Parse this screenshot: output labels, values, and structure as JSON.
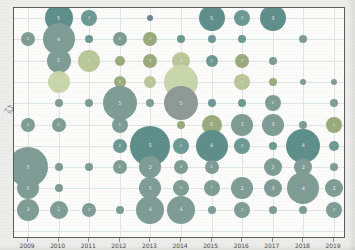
{
  "chart_data": {
    "type": "scatter",
    "title": "",
    "xlabel": "",
    "ylabel": "心",
    "grid": true,
    "legend": null,
    "x_tick_labels": [
      "2009",
      "2010",
      "2011",
      "2012",
      "2013",
      "2014",
      "2015",
      "2016",
      "2017",
      "2018",
      "2019"
    ],
    "x_values": [
      2009,
      2010,
      2011,
      2012,
      2013,
      2014,
      2015,
      2016,
      2017,
      2018,
      2019
    ],
    "y_rows": 11,
    "size_encodes": "count",
    "label_shows": "count",
    "colors": {
      "dark_teal": "#5f8f8b",
      "teal": "#6d9a94",
      "gray_teal": "#7f9c97",
      "olive": "#9aab7e",
      "light_olive": "#b9c79a",
      "pale_green": "#c9d6ac",
      "slate": "#6f8790",
      "muted_gray": "#8d9a96",
      "grid": "#dfe4e4",
      "frame": "#5c5c5a",
      "plot_bg": "#fbfbfa",
      "page_bg": "#ececeb"
    },
    "points": [
      {
        "col": 1,
        "row": 0,
        "v": 5,
        "r": 14,
        "c": "dark_teal"
      },
      {
        "col": 2,
        "row": 0,
        "v": 2,
        "r": 8,
        "c": "teal"
      },
      {
        "col": 4,
        "row": 0,
        "v": 1,
        "r": 3,
        "c": "slate"
      },
      {
        "col": 6,
        "row": 0,
        "v": 5,
        "r": 13,
        "c": "dark_teal"
      },
      {
        "col": 7,
        "row": 0,
        "v": 2,
        "r": 8,
        "c": "teal"
      },
      {
        "col": 8,
        "row": 0,
        "v": 3,
        "r": 13,
        "c": "dark_teal"
      },
      {
        "col": 0,
        "row": 1,
        "v": 2,
        "r": 7,
        "c": "gray_teal"
      },
      {
        "col": 1,
        "row": 1,
        "v": 4,
        "r": 16,
        "c": "gray_teal"
      },
      {
        "col": 2,
        "row": 1,
        "v": 1,
        "r": 4,
        "c": "teal"
      },
      {
        "col": 3,
        "row": 1,
        "v": 2,
        "r": 7,
        "c": "gray_teal"
      },
      {
        "col": 4,
        "row": 1,
        "v": 2,
        "r": 7,
        "c": "olive"
      },
      {
        "col": 5,
        "row": 1,
        "v": 1,
        "r": 4,
        "c": "teal"
      },
      {
        "col": 6,
        "row": 1,
        "v": 1,
        "r": 4,
        "c": "teal"
      },
      {
        "col": 7,
        "row": 1,
        "v": 1,
        "r": 4,
        "c": "teal"
      },
      {
        "col": 9,
        "row": 1,
        "v": 1,
        "r": 4,
        "c": "gray_teal"
      },
      {
        "col": 1,
        "row": 2,
        "v": 5,
        "r": 12,
        "c": "gray_teal"
      },
      {
        "col": 2,
        "row": 2,
        "v": 1,
        "r": 11,
        "c": "light_olive"
      },
      {
        "col": 3,
        "row": 2,
        "v": 1,
        "r": 5,
        "c": "olive"
      },
      {
        "col": 4,
        "row": 2,
        "v": 2,
        "r": 7,
        "c": "olive"
      },
      {
        "col": 5,
        "row": 2,
        "v": 1,
        "r": 9,
        "c": "light_olive"
      },
      {
        "col": 6,
        "row": 2,
        "v": 2,
        "r": 6,
        "c": "teal"
      },
      {
        "col": 7,
        "row": 2,
        "v": 2,
        "r": 7,
        "c": "olive"
      },
      {
        "col": 8,
        "row": 2,
        "v": 1,
        "r": 4,
        "c": "gray_teal"
      },
      {
        "col": 1,
        "row": 3,
        "v": 3,
        "r": 11,
        "c": "pale_green"
      },
      {
        "col": 3,
        "row": 3,
        "v": 2,
        "r": 6,
        "c": "olive"
      },
      {
        "col": 4,
        "row": 3,
        "v": 2,
        "r": 6,
        "c": "light_olive"
      },
      {
        "col": 5,
        "row": 3,
        "v": 5,
        "r": 17,
        "c": "pale_green"
      },
      {
        "col": 7,
        "row": 3,
        "v": 2,
        "r": 8,
        "c": "light_olive"
      },
      {
        "col": 8,
        "row": 3,
        "v": 1,
        "r": 4,
        "c": "olive"
      },
      {
        "col": 9,
        "row": 3,
        "v": 1,
        "r": 3,
        "c": "gray_teal"
      },
      {
        "col": 10,
        "row": 3,
        "v": 1,
        "r": 3,
        "c": "gray_teal"
      },
      {
        "col": 1,
        "row": 4,
        "v": 1,
        "r": 4,
        "c": "gray_teal"
      },
      {
        "col": 2,
        "row": 4,
        "v": 1,
        "r": 4,
        "c": "gray_teal"
      },
      {
        "col": 3,
        "row": 4,
        "v": 5,
        "r": 17,
        "c": "gray_teal"
      },
      {
        "col": 4,
        "row": 4,
        "v": 1,
        "r": 4,
        "c": "gray_teal"
      },
      {
        "col": 5,
        "row": 4,
        "v": 5,
        "r": 17,
        "c": "muted_gray"
      },
      {
        "col": 6,
        "row": 4,
        "v": 1,
        "r": 4,
        "c": "teal"
      },
      {
        "col": 7,
        "row": 4,
        "v": 1,
        "r": 4,
        "c": "teal"
      },
      {
        "col": 8,
        "row": 4,
        "v": 2,
        "r": 8,
        "c": "gray_teal"
      },
      {
        "col": 10,
        "row": 4,
        "v": 1,
        "r": 4,
        "c": "gray_teal"
      },
      {
        "col": 0,
        "row": 5,
        "v": 2,
        "r": 7,
        "c": "gray_teal"
      },
      {
        "col": 1,
        "row": 5,
        "v": 2,
        "r": 7,
        "c": "gray_teal"
      },
      {
        "col": 3,
        "row": 5,
        "v": 1,
        "r": 8,
        "c": "gray_teal"
      },
      {
        "col": 5,
        "row": 5,
        "v": 1,
        "r": 4,
        "c": "olive"
      },
      {
        "col": 6,
        "row": 5,
        "v": 5,
        "r": 10,
        "c": "olive"
      },
      {
        "col": 7,
        "row": 5,
        "v": 3,
        "r": 11,
        "c": "gray_teal"
      },
      {
        "col": 8,
        "row": 5,
        "v": 3,
        "r": 11,
        "c": "gray_teal"
      },
      {
        "col": 9,
        "row": 5,
        "v": 1,
        "r": 4,
        "c": "gray_teal"
      },
      {
        "col": 10,
        "row": 5,
        "v": 2,
        "r": 8,
        "c": "olive"
      },
      {
        "col": 3,
        "row": 6,
        "v": 2,
        "r": 7,
        "c": "teal"
      },
      {
        "col": 4,
        "row": 6,
        "v": 5,
        "r": 20,
        "c": "dark_teal"
      },
      {
        "col": 5,
        "row": 6,
        "v": 2,
        "r": 8,
        "c": "teal"
      },
      {
        "col": 6,
        "row": 6,
        "v": 4,
        "r": 16,
        "c": "dark_teal"
      },
      {
        "col": 7,
        "row": 6,
        "v": 2,
        "r": 8,
        "c": "teal"
      },
      {
        "col": 8,
        "row": 6,
        "v": 1,
        "r": 4,
        "c": "teal"
      },
      {
        "col": 9,
        "row": 6,
        "v": 4,
        "r": 17,
        "c": "dark_teal"
      },
      {
        "col": 10,
        "row": 6,
        "v": 1,
        "r": 5,
        "c": "teal"
      },
      {
        "col": 0,
        "row": 7,
        "v": 5,
        "r": 20,
        "c": "gray_teal"
      },
      {
        "col": 1,
        "row": 7,
        "v": 1,
        "r": 4,
        "c": "gray_teal"
      },
      {
        "col": 2,
        "row": 7,
        "v": 1,
        "r": 4,
        "c": "gray_teal"
      },
      {
        "col": 3,
        "row": 7,
        "v": 2,
        "r": 7,
        "c": "gray_teal"
      },
      {
        "col": 4,
        "row": 7,
        "v": 2,
        "r": 11,
        "c": "gray_teal"
      },
      {
        "col": 5,
        "row": 7,
        "v": 2,
        "r": 7,
        "c": "gray_teal"
      },
      {
        "col": 6,
        "row": 7,
        "v": 2,
        "r": 7,
        "c": "gray_teal"
      },
      {
        "col": 8,
        "row": 7,
        "v": 2,
        "r": 9,
        "c": "gray_teal"
      },
      {
        "col": 9,
        "row": 7,
        "v": 2,
        "r": 9,
        "c": "gray_teal"
      },
      {
        "col": 10,
        "row": 7,
        "v": 1,
        "r": 4,
        "c": "gray_teal"
      },
      {
        "col": 0,
        "row": 8,
        "v": 5,
        "r": 11,
        "c": "gray_teal"
      },
      {
        "col": 1,
        "row": 8,
        "v": 1,
        "r": 4,
        "c": "gray_teal"
      },
      {
        "col": 4,
        "row": 8,
        "v": 5,
        "r": 11,
        "c": "gray_teal"
      },
      {
        "col": 5,
        "row": 8,
        "v": 2,
        "r": 8,
        "c": "gray_teal"
      },
      {
        "col": 6,
        "row": 8,
        "v": 7,
        "r": 8,
        "c": "gray_teal"
      },
      {
        "col": 7,
        "row": 8,
        "v": 2,
        "r": 11,
        "c": "gray_teal"
      },
      {
        "col": 8,
        "row": 8,
        "v": 3,
        "r": 9,
        "c": "gray_teal"
      },
      {
        "col": 9,
        "row": 8,
        "v": 4,
        "r": 16,
        "c": "gray_teal"
      },
      {
        "col": 10,
        "row": 8,
        "v": 2,
        "r": 9,
        "c": "gray_teal"
      },
      {
        "col": 0,
        "row": 9,
        "v": 3,
        "r": 11,
        "c": "gray_teal"
      },
      {
        "col": 1,
        "row": 9,
        "v": 1,
        "r": 9,
        "c": "gray_teal"
      },
      {
        "col": 2,
        "row": 9,
        "v": 2,
        "r": 7,
        "c": "gray_teal"
      },
      {
        "col": 3,
        "row": 9,
        "v": 1,
        "r": 4,
        "c": "gray_teal"
      },
      {
        "col": 4,
        "row": 9,
        "v": 4,
        "r": 14,
        "c": "gray_teal"
      },
      {
        "col": 5,
        "row": 9,
        "v": 4,
        "r": 14,
        "c": "gray_teal"
      },
      {
        "col": 6,
        "row": 9,
        "v": 1,
        "r": 4,
        "c": "gray_teal"
      },
      {
        "col": 7,
        "row": 9,
        "v": 2,
        "r": 8,
        "c": "gray_teal"
      },
      {
        "col": 8,
        "row": 9,
        "v": 1,
        "r": 4,
        "c": "gray_teal"
      },
      {
        "col": 9,
        "row": 9,
        "v": 1,
        "r": 4,
        "c": "gray_teal"
      },
      {
        "col": 10,
        "row": 9,
        "v": 2,
        "r": 8,
        "c": "gray_teal"
      }
    ]
  }
}
